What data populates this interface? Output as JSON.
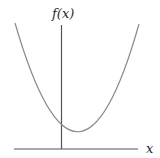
{
  "diagram": {
    "type": "function-graph",
    "y_axis_label": "f(x)",
    "x_axis_label": "x",
    "colors": {
      "axis": "#555555",
      "curve": "#8a8a8a",
      "background": "#ffffff"
    }
  }
}
